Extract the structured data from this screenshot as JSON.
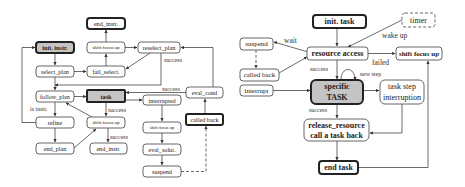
{
  "left_diagram": {
    "nodes": {
      "end_instr_top": "end_instr.",
      "init_instr": "init. instr.",
      "shift_focus_up_top": "shift focus up",
      "reselect_plan": "reselect_plan",
      "select_plan": "select_plan",
      "fail_select": "fail_select.",
      "follow_plan": "follow_plan",
      "task": "task",
      "eval_cond": "eval_cond",
      "interrupted": "interrupted",
      "called_back": "called back",
      "refine": "refine",
      "shift_focus_up_mid": "shift focus up",
      "shift_focus_up_right": "shift focus up",
      "end_plan": "end_plan",
      "end_instr_bottom": "end_instr.",
      "eval_solut": "eval_solut.",
      "suspend": "suspend"
    },
    "edge_labels": {
      "reselect_success": "success",
      "eval_cond_success": "success",
      "is_instr": "is instr.",
      "task_success": "success",
      "shift_success": "success"
    }
  },
  "right_diagram": {
    "nodes": {
      "init_task": "init. task",
      "timer": "timer",
      "suspend": "suspend",
      "resource_access": "resource access",
      "shift_focus_up": "shift focus up",
      "called_back": "called back",
      "interrupt": "interrupt",
      "specific_task_line1": "specific",
      "specific_task_line2": "TASK",
      "task_step_line1": "task step",
      "task_step_line2": "interruption",
      "release_line1": "release_resource",
      "release_line2": "call a task back",
      "end_task": "end task"
    },
    "edge_labels": {
      "wait": "wait",
      "wake_up": "wake up",
      "failed": "failed",
      "success_top": "success",
      "new_step": "new step",
      "success_bottom": "success"
    }
  }
}
